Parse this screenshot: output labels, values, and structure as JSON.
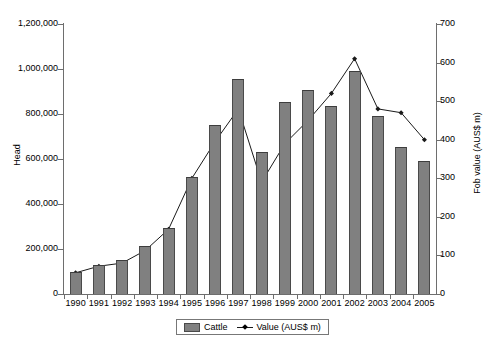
{
  "chart_data": {
    "type": "bar",
    "title": "",
    "xlabel": "",
    "ylabel": "Head",
    "y2label": "Fob value (AUS$ m)",
    "categories": [
      "1990",
      "1991",
      "1992",
      "1993",
      "1994",
      "1995",
      "1996",
      "1997",
      "1998",
      "1999",
      "2000",
      "2001",
      "2002",
      "2003",
      "2004",
      "2005"
    ],
    "ylim": [
      0,
      1200000
    ],
    "y2lim": [
      0,
      700
    ],
    "yticks": [
      "0",
      "200,000",
      "400,000",
      "600,000",
      "800,000",
      "1,000,000",
      "1,200,000"
    ],
    "ytick_values": [
      0,
      200000,
      400000,
      600000,
      800000,
      1000000,
      1200000
    ],
    "y2ticks": [
      "0",
      "100",
      "200",
      "300",
      "400",
      "500",
      "600",
      "700"
    ],
    "y2tick_values": [
      0,
      100,
      200,
      300,
      400,
      500,
      600,
      700
    ],
    "grid": false,
    "legend_position": "bottom",
    "series": [
      {
        "name": "Cattle",
        "type": "bar",
        "axis": "left",
        "color": "#808080",
        "values": [
          100000,
          128000,
          152000,
          215000,
          295000,
          520000,
          750000,
          955000,
          630000,
          855000,
          905000,
          835000,
          990000,
          790000,
          655000,
          590000
        ]
      },
      {
        "name": "Value (AUS$ m)",
        "type": "line",
        "axis": "right",
        "color": "#1a1a1a",
        "values": [
          55,
          72,
          80,
          113,
          168,
          300,
          395,
          480,
          290,
          390,
          450,
          520,
          610,
          480,
          470,
          400
        ]
      }
    ]
  },
  "legend": {
    "entries": [
      {
        "label": "Cattle",
        "marker": "bar-swatch"
      },
      {
        "label": "Value (AUS$ m)",
        "marker": "line-marker"
      }
    ]
  }
}
